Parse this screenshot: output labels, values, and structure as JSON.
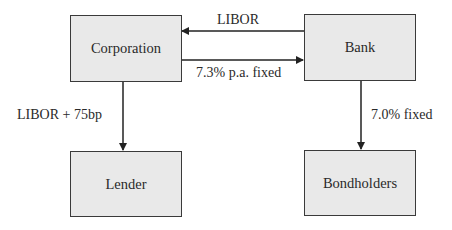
{
  "diagram": {
    "type": "interest-rate-swap-flow",
    "nodes": [
      {
        "id": "corporation",
        "label": "Corporation"
      },
      {
        "id": "bank",
        "label": "Bank"
      },
      {
        "id": "lender",
        "label": "Lender"
      },
      {
        "id": "bondholders",
        "label": "Bondholders"
      }
    ],
    "edges": [
      {
        "from": "bank",
        "to": "corporation",
        "label": "LIBOR"
      },
      {
        "from": "corporation",
        "to": "bank",
        "label": "7.3% p.a. fixed"
      },
      {
        "from": "corporation",
        "to": "lender",
        "label": "LIBOR + 75bp"
      },
      {
        "from": "bank",
        "to": "bondholders",
        "label": "7.0% fixed"
      }
    ],
    "colors": {
      "box_fill": "#e9e9e9",
      "stroke": "#3a3a3a",
      "text": "#2a2a2a"
    }
  }
}
